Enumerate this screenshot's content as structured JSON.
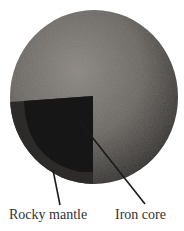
{
  "diagram": {
    "labels": {
      "mantle": "Rocky mantle",
      "core": "Iron core"
    },
    "colors": {
      "surface": "#6e6a66",
      "mantle": "#2a2a2a",
      "core": "#141414",
      "leader": "#1a1a1a"
    }
  }
}
